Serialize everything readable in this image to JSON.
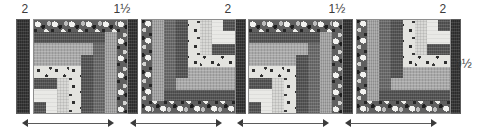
{
  "diagram": {
    "top_labels": [
      {
        "text": "2",
        "x": 12,
        "width": 26
      },
      {
        "text": "1½",
        "x": 107,
        "width": 30
      },
      {
        "text": "2",
        "x": 215,
        "width": 26
      },
      {
        "text": "1½",
        "x": 322,
        "width": 30
      },
      {
        "text": "2",
        "x": 430,
        "width": 26
      }
    ],
    "side_label": {
      "text": "9½",
      "x": 455,
      "y": 58
    },
    "sashing": [
      {
        "name": "sashing-strip-1",
        "x": 16
      },
      {
        "name": "sashing-strip-2",
        "x": 124
      },
      {
        "name": "sashing-strip-3",
        "x": 232
      },
      {
        "name": "sashing-strip-4",
        "x": 339
      },
      {
        "name": "sashing-strip-5",
        "x": 447
      }
    ],
    "blocks": [
      {
        "name": "log-cabin-block-1",
        "x": 33,
        "orientation": "normal"
      },
      {
        "name": "log-cabin-block-2",
        "x": 141,
        "orientation": "rotated-180"
      },
      {
        "name": "log-cabin-block-3",
        "x": 248,
        "orientation": "normal"
      },
      {
        "name": "log-cabin-block-4",
        "x": 356,
        "orientation": "rotated-180"
      }
    ],
    "block_logs": [
      {
        "fabric": "floral",
        "left": 0,
        "top": 0,
        "width": 95,
        "height": 12
      },
      {
        "fabric": "floral",
        "left": 83,
        "top": 0,
        "width": 12,
        "height": 95
      },
      {
        "fabric": "charcoal",
        "left": 0,
        "top": 12,
        "width": 71,
        "height": 11
      },
      {
        "fabric": "gray",
        "left": 71,
        "top": 12,
        "width": 12,
        "height": 83
      },
      {
        "fabric": "midgray",
        "left": 0,
        "top": 23,
        "width": 59,
        "height": 12
      },
      {
        "fabric": "darkgray",
        "left": 59,
        "top": 23,
        "width": 12,
        "height": 72
      },
      {
        "fabric": "midgray",
        "left": 0,
        "top": 35,
        "width": 47,
        "height": 11
      },
      {
        "fabric": "charcoal",
        "left": 47,
        "top": 35,
        "width": 12,
        "height": 60
      },
      {
        "fabric": "dot",
        "left": 0,
        "top": 46,
        "width": 35,
        "height": 12
      },
      {
        "fabric": "dot",
        "left": 35,
        "top": 46,
        "width": 12,
        "height": 49
      },
      {
        "fabric": "charcoal",
        "left": 0,
        "top": 58,
        "width": 23,
        "height": 11
      },
      {
        "fabric": "cream",
        "left": 23,
        "top": 58,
        "width": 12,
        "height": 37
      },
      {
        "fabric": "white",
        "left": 0,
        "top": 69,
        "width": 23,
        "height": 26
      },
      {
        "fabric": "charcoal",
        "left": 0,
        "top": 82,
        "width": 12,
        "height": 13
      }
    ],
    "arrows": [
      {
        "name": "measure-arrow-block-1",
        "x": 22,
        "width": 92
      },
      {
        "name": "measure-arrow-block-2",
        "x": 130,
        "width": 92
      },
      {
        "name": "measure-arrow-block-3",
        "x": 237,
        "width": 92
      },
      {
        "name": "measure-arrow-block-4",
        "x": 345,
        "width": 92
      }
    ]
  }
}
